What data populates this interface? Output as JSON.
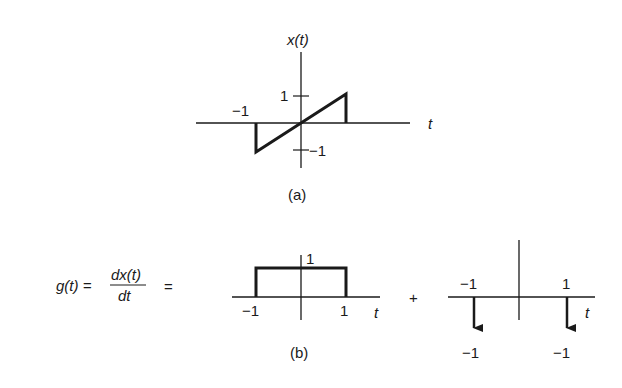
{
  "panel_a": {
    "title": "x(t)",
    "axis_label": "t",
    "tick_pos": "1",
    "tick_neg": "−1",
    "left_mark": "−1",
    "caption": "(a)"
  },
  "panel_b": {
    "lhs_g": "g(t) =",
    "frac_num": "dx(t)",
    "frac_den": "dt",
    "equals": "=",
    "plus": "+",
    "rect": {
      "height_label": "1",
      "left_label": "−1",
      "right_label": "1",
      "axis_label": "t"
    },
    "impulses": {
      "left_pos_label": "−1",
      "right_pos_label": "1",
      "left_amp_label": "−1",
      "right_amp_label": "−1",
      "axis_label": "t"
    },
    "caption": "(b)"
  },
  "colors": {
    "ink": "#1a1a1a",
    "background": "#ffffff"
  }
}
